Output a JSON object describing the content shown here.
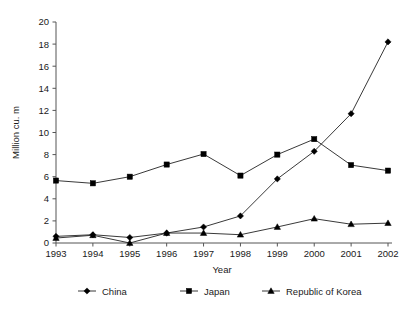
{
  "chart_data": {
    "type": "line",
    "title": "",
    "xlabel": "Year",
    "ylabel": "Million cu. m",
    "categories": [
      "1993",
      "1994",
      "1995",
      "1996",
      "1997",
      "1998",
      "1999",
      "2000",
      "2001",
      "2002"
    ],
    "x": [
      1993,
      1994,
      1995,
      1996,
      1997,
      1998,
      1999,
      2000,
      2001,
      2002
    ],
    "ylim": [
      0,
      20
    ],
    "yticks": [
      0,
      2,
      4,
      6,
      8,
      10,
      12,
      14,
      16,
      18,
      20
    ],
    "ytick_labels": [
      "0",
      "2",
      "4",
      "6",
      "8",
      "10",
      "12",
      "14",
      "16",
      "18",
      "20"
    ],
    "grid": false,
    "legend_position": "bottom",
    "series": [
      {
        "name": "China",
        "marker": "diamond",
        "color": "#000000",
        "values": [
          0.6,
          0.75,
          0.5,
          0.9,
          1.45,
          2.45,
          5.8,
          8.3,
          11.7,
          18.2
        ]
      },
      {
        "name": "Japan",
        "marker": "square",
        "color": "#000000",
        "values": [
          5.65,
          5.4,
          6.0,
          7.1,
          8.05,
          6.1,
          8.0,
          9.4,
          7.05,
          6.55
        ]
      },
      {
        "name": "Republic of Korea",
        "marker": "triangle",
        "color": "#000000",
        "values": [
          0.45,
          0.7,
          0.0,
          0.9,
          0.9,
          0.75,
          1.45,
          2.2,
          1.7,
          1.8
        ]
      }
    ]
  },
  "legend": {
    "items": [
      {
        "label": "China",
        "marker": "diamond"
      },
      {
        "label": "Japan",
        "marker": "square"
      },
      {
        "label": "Republic of Korea",
        "marker": "triangle"
      }
    ]
  }
}
